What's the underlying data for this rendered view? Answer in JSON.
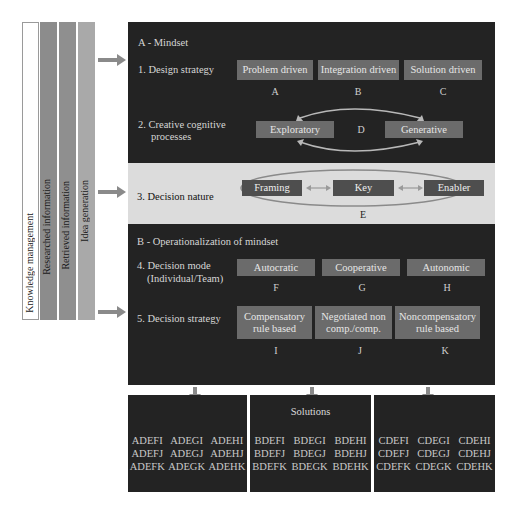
{
  "left_bars": [
    {
      "label": "Knowledge management",
      "color": "#ffffff"
    },
    {
      "label": "Researched information",
      "color": "#8c8c8c"
    },
    {
      "label": "Retrieved information",
      "color": "#8f8f8f"
    },
    {
      "label": "Idea generation",
      "color": "#a9a9a9"
    }
  ],
  "section_a": {
    "title": "A - Mindset",
    "row1": {
      "label": "1. Design strategy",
      "options": [
        {
          "label": "Problem driven",
          "letter": "A"
        },
        {
          "label": "Integration driven",
          "letter": "B"
        },
        {
          "label": "Solution driven",
          "letter": "C"
        }
      ]
    },
    "row2": {
      "label_line1": "2. Creative cognitive",
      "label_line2": "processes",
      "options": [
        {
          "label": "Exploratory"
        },
        {
          "label": "Generative"
        }
      ],
      "letter": "D"
    },
    "row3": {
      "label": "3. Decision nature",
      "options": [
        {
          "label": "Framing"
        },
        {
          "label": "Key"
        },
        {
          "label": "Enabler"
        }
      ],
      "letter": "E"
    }
  },
  "section_b": {
    "title": "B - Operationalization of mindset",
    "row4": {
      "label_line1": "4. Decision mode",
      "label_line2": "(Individual/Team)",
      "options": [
        {
          "label": "Autocratic",
          "letter": "F"
        },
        {
          "label": "Cooperative",
          "letter": "G"
        },
        {
          "label": "Autonomic",
          "letter": "H"
        }
      ]
    },
    "row5": {
      "label": "5. Decision strategy",
      "options": [
        {
          "line1": "Compensatory",
          "line2": "rule based",
          "letter": "I"
        },
        {
          "line1": "Negotiated non",
          "line2": "comp./comp.",
          "letter": "J"
        },
        {
          "line1": "Noncompensatory",
          "line2": "rule based",
          "letter": "K"
        }
      ]
    }
  },
  "solutions": {
    "title": "Solutions",
    "groups": [
      {
        "rows": [
          [
            "ADEFI",
            "ADEGI",
            "ADEHI"
          ],
          [
            "ADEFJ",
            "ADEGJ",
            "ADEHJ"
          ],
          [
            "ADEFK",
            "ADEGK",
            "ADEHK"
          ]
        ]
      },
      {
        "rows": [
          [
            "BDEFI",
            "BDEGI",
            "BDEHI"
          ],
          [
            "BDEFJ",
            "BDEGJ",
            "BDEHJ"
          ],
          [
            "BDEFK",
            "BDEGK",
            "BDEHK"
          ]
        ]
      },
      {
        "rows": [
          [
            "CDEFI",
            "CDEGI",
            "CDEHI"
          ],
          [
            "CDEFJ",
            "CDEGJ",
            "CDEHJ"
          ],
          [
            "CDEFK",
            "CDEGK",
            "CDEHK"
          ]
        ]
      }
    ]
  },
  "colors": {
    "panel_dark": "#232323",
    "band_light": "#dcdcdc",
    "box_gray": "#6b6b6b",
    "box_dark": "#4e4e4e",
    "arrow_gray": "#8a8a8a"
  }
}
